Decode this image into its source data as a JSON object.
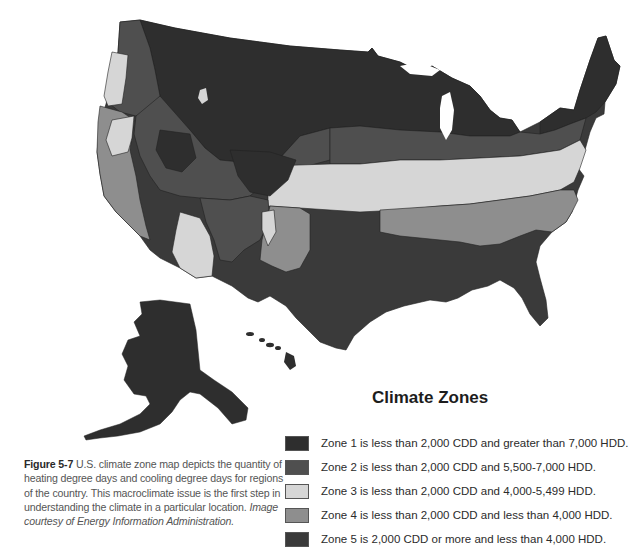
{
  "legend": {
    "title": "Climate Zones",
    "items": [
      {
        "zone": "Zone 1",
        "label": "Zone 1 is less than 2,000 CDD and greater than 7,000 HDD.",
        "color": "#2e2e2e"
      },
      {
        "zone": "Zone 2",
        "label": "Zone 2 is less than 2,000 CDD and 5,500-7,000 HDD.",
        "color": "#4f4f4f"
      },
      {
        "zone": "Zone 3",
        "label": "Zone 3 is less than 2,000 CDD and 4,000-5,499 HDD.",
        "color": "#d6d6d6"
      },
      {
        "zone": "Zone 4",
        "label": "Zone 4 is less than 2,000 CDD and less than 4,000 HDD.",
        "color": "#8e8e8e"
      },
      {
        "zone": "Zone 5",
        "label": "Zone 5 is 2,000 CDD or more and less than 4,000 HDD.",
        "color": "#3a3a3a"
      }
    ]
  },
  "caption": {
    "figure_label": "Figure 5-7",
    "text": " U.S. climate zone map depicts the quantity of heating degree days and cooling degree days for regions of the country. This macroclimate issue is the first step in understanding the climate in a particular location. ",
    "credit": "Image courtesy of Energy Information Administration."
  },
  "map": {
    "regions": [
      "Contiguous United States",
      "Alaska",
      "Hawaii"
    ],
    "colors": {
      "zone1": "#2e2e2e",
      "zone2": "#4f4f4f",
      "zone3": "#d6d6d6",
      "zone4": "#8e8e8e",
      "zone5": "#3a3a3a",
      "water": "#ffffff"
    }
  }
}
